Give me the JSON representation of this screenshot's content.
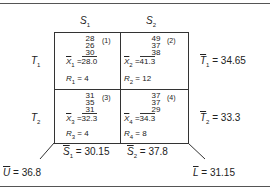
{
  "columns": [
    {
      "label": "S",
      "sub": "1"
    },
    {
      "label": "S",
      "sub": "2"
    }
  ],
  "rows": [
    {
      "label": "T",
      "sub": "1",
      "mean_label": "T",
      "mean_sub": "1",
      "mean_value": "= 34.65"
    },
    {
      "label": "T",
      "sub": "2",
      "mean_label": "T",
      "mean_sub": "2",
      "mean_value": "= 33.3"
    }
  ],
  "cells": [
    {
      "tag": "(1)",
      "values": [
        "28",
        "26",
        "30"
      ],
      "mean_label": "X",
      "mean_sub": "1",
      "mean_value": "28.0",
      "range_label": "R",
      "range_sub": "1",
      "range_value": "= 4"
    },
    {
      "tag": "(2)",
      "values": [
        "49",
        "37",
        "38"
      ],
      "mean_label": "X",
      "mean_sub": "2",
      "mean_value": "41.3",
      "range_label": "R",
      "range_sub": "2",
      "range_value": "= 12"
    },
    {
      "tag": "(3)",
      "values": [
        "31",
        "35",
        "31"
      ],
      "mean_label": "X",
      "mean_sub": "3",
      "mean_value": "32.3",
      "range_label": "R",
      "range_sub": "3",
      "range_value": "= 4"
    },
    {
      "tag": "(4)",
      "values": [
        "37",
        "37",
        "29"
      ],
      "mean_label": "X",
      "mean_sub": "4",
      "mean_value": "34.3",
      "range_label": "R",
      "range_sub": "4",
      "range_value": "= 8"
    }
  ],
  "column_means": [
    {
      "label": "S",
      "sub": "1",
      "value": "= 30.15"
    },
    {
      "label": "S",
      "sub": "2",
      "value": "= 37.8"
    }
  ],
  "corners": {
    "upper": {
      "label": "U",
      "value": "= 36.8"
    },
    "lower": {
      "label": "L",
      "value": "= 31.15"
    }
  },
  "equals_sign": "="
}
